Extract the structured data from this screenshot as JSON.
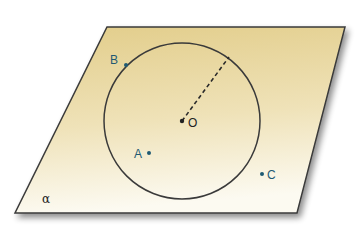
{
  "diagram": {
    "title": "",
    "plane": {
      "label": "α",
      "corners": [
        [
          107,
          27
        ],
        [
          345,
          27
        ],
        [
          297,
          213
        ],
        [
          15,
          213
        ]
      ],
      "fill_top": "#e3cf8e",
      "fill_bottom": "#fbf8ee",
      "stroke": "#3a3a3a"
    },
    "circle": {
      "center_label": "O",
      "cx": 182,
      "cy": 121,
      "r": 78,
      "stroke": "#3a3a3a"
    },
    "radius_line": {
      "from": [
        182,
        121
      ],
      "to": [
        229,
        57
      ],
      "style": "dashed"
    },
    "points": [
      {
        "name": "B",
        "x": 126,
        "y": 65,
        "label_x": 110,
        "label_y": 63
      },
      {
        "name": "A",
        "x": 149,
        "y": 153,
        "label_x": 134,
        "label_y": 157
      },
      {
        "name": "C",
        "x": 262,
        "y": 174,
        "label_x": 267,
        "label_y": 178
      }
    ],
    "point_color": "#1f5a73"
  }
}
